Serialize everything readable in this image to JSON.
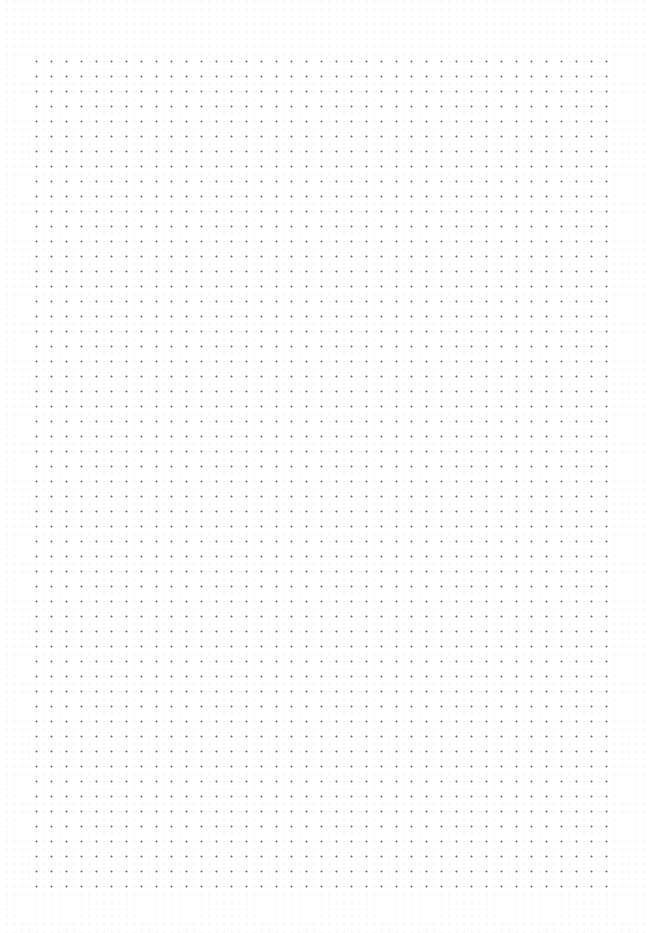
{
  "document": {
    "kind": "dot-grid-paper",
    "title": "",
    "body_text": "",
    "annotations": []
  },
  "page": {
    "width": 649,
    "height": 933,
    "background_color": "#ffffff"
  },
  "grid": {
    "type": "dot",
    "pitch_px": 15,
    "dot_size_px": 1.5,
    "dot_color": "#55555a",
    "dot_opacity": 0.92,
    "columns": 40,
    "rows": 57,
    "origin_x": 30,
    "origin_y": 55,
    "margin_left": 30,
    "margin_top": 55,
    "margin_right": 37,
    "margin_bottom": 45
  },
  "grain": {
    "color": "#9a9aa2",
    "opacity": 0.35
  }
}
